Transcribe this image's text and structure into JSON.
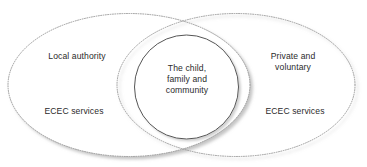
{
  "diagram": {
    "type": "venn-diagram",
    "background_color": "#ffffff",
    "ellipse_stroke_color": "#9a9a9a",
    "circle_stroke_color": "#555555",
    "shadow_color": "#c8c8c8",
    "text_color": "#2b2b2b",
    "left_ellipse": {
      "labels": {
        "top": "Local authority",
        "bottom": "ECEC services"
      }
    },
    "right_ellipse": {
      "labels": {
        "top": "Private and\nvoluntary",
        "bottom": "ECEC services"
      }
    },
    "center_circle": {
      "label": "The child,\nfamily and\ncommunity"
    }
  }
}
